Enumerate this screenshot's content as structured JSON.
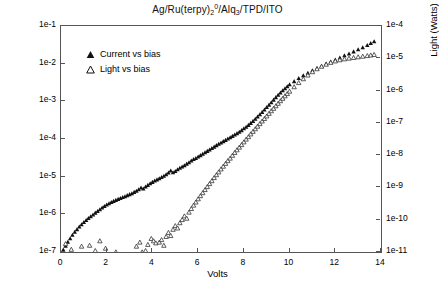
{
  "chart_data": {
    "type": "scatter",
    "title_parts": {
      "p1": "Ag/Ru(terpy)",
      "sub1": "2",
      "sup1": "0",
      "p2": "/Alq",
      "sub2": "3",
      "p3": "/TPD/ITO"
    },
    "xlabel": "Volts",
    "ylabel": "Current (Amps)",
    "ylabel_right": "Light (Watts)",
    "xlim": [
      0,
      14
    ],
    "xticks": [
      0,
      2,
      4,
      6,
      8,
      10,
      12,
      14
    ],
    "xticklabels": [
      "0",
      "2",
      "4",
      "6",
      "8",
      "10",
      "12",
      "14"
    ],
    "ylim_left": [
      1e-07,
      0.1
    ],
    "yticks_left": [
      1e-07,
      1e-06,
      1e-05,
      0.0001,
      0.001,
      0.01,
      0.1
    ],
    "yticklabels_left": [
      "1e-7",
      "1e-6",
      "1e-5",
      "1e-4",
      "1e-3",
      "1e-2",
      "1e-1"
    ],
    "ylim_right": [
      1e-11,
      0.0001
    ],
    "yticks_right": [
      1e-11,
      1e-10,
      1e-09,
      1e-08,
      1e-07,
      1e-06,
      1e-05,
      0.0001
    ],
    "yticklabels_right": [
      "1e-11",
      "1e-10",
      "1e-9",
      "1e-8",
      "1e-7",
      "1e-6",
      "1e-5",
      "1e-4"
    ],
    "yscale": "log",
    "grid": false,
    "legend_position": "upper left",
    "series": [
      {
        "name": "Current vs bias",
        "marker": "triangle-filled",
        "axis": "left",
        "color": "#111111",
        "points": [
          [
            0.1,
            1.15e-07
          ],
          [
            0.2,
            1.45e-07
          ],
          [
            0.3,
            1.85e-07
          ],
          [
            0.4,
            2.3e-07
          ],
          [
            0.5,
            2.85e-07
          ],
          [
            0.6,
            3.4e-07
          ],
          [
            0.7,
            4e-07
          ],
          [
            0.8,
            4.7e-07
          ],
          [
            0.9,
            5.4e-07
          ],
          [
            1.0,
            6.2e-07
          ],
          [
            1.1,
            7e-07
          ],
          [
            1.2,
            7.9e-07
          ],
          [
            1.3,
            8.8e-07
          ],
          [
            1.4,
            9.8e-07
          ],
          [
            1.5,
            1.1e-06
          ],
          [
            1.6,
            1.22e-06
          ],
          [
            1.7,
            1.35e-06
          ],
          [
            1.8,
            1.5e-06
          ],
          [
            1.9,
            1.65e-06
          ],
          [
            2.0,
            1.8e-06
          ],
          [
            2.1,
            1.95e-06
          ],
          [
            2.2,
            2.1e-06
          ],
          [
            2.3,
            2.25e-06
          ],
          [
            2.4,
            2.4e-06
          ],
          [
            2.5,
            2.55e-06
          ],
          [
            2.6,
            2.7e-06
          ],
          [
            2.7,
            2.85e-06
          ],
          [
            2.8,
            3e-06
          ],
          [
            2.9,
            3.2e-06
          ],
          [
            3.0,
            3.4e-06
          ],
          [
            3.1,
            3.6e-06
          ],
          [
            3.2,
            3.9e-06
          ],
          [
            3.3,
            4.2e-06
          ],
          [
            3.4,
            4.6e-06
          ],
          [
            3.5,
            5.1e-06
          ],
          [
            3.6,
            4.8e-06
          ],
          [
            3.7,
            5.4e-06
          ],
          [
            3.8,
            6e-06
          ],
          [
            3.9,
            6.6e-06
          ],
          [
            4.0,
            7.2e-06
          ],
          [
            4.1,
            7.8e-06
          ],
          [
            4.2,
            8.4e-06
          ],
          [
            4.3,
            9e-06
          ],
          [
            4.4,
            9.7e-06
          ],
          [
            4.5,
            1.05e-05
          ],
          [
            4.6,
            1.15e-05
          ],
          [
            4.7,
            1.28e-05
          ],
          [
            4.8,
            1.45e-05
          ],
          [
            4.9,
            1.3e-05
          ],
          [
            5.0,
            1.4e-05
          ],
          [
            5.1,
            1.55e-05
          ],
          [
            5.2,
            1.7e-05
          ],
          [
            5.3,
            1.85e-05
          ],
          [
            5.4,
            2e-05
          ],
          [
            5.5,
            2.2e-05
          ],
          [
            5.6,
            2.4e-05
          ],
          [
            5.7,
            2.65e-05
          ],
          [
            5.8,
            2.9e-05
          ],
          [
            5.9,
            3.1e-05
          ],
          [
            6.0,
            3.4e-05
          ],
          [
            6.1,
            3.7e-05
          ],
          [
            6.2,
            4e-05
          ],
          [
            6.3,
            4.4e-05
          ],
          [
            6.4,
            4.8e-05
          ],
          [
            6.5,
            5.2e-05
          ],
          [
            6.6,
            5.7e-05
          ],
          [
            6.7,
            6.2e-05
          ],
          [
            6.8,
            6.8e-05
          ],
          [
            6.9,
            7.4e-05
          ],
          [
            7.0,
            8e-05
          ],
          [
            7.1,
            8.7e-05
          ],
          [
            7.2,
            9.4e-05
          ],
          [
            7.3,
            0.000102
          ],
          [
            7.4,
            0.00011
          ],
          [
            7.5,
            0.00012
          ],
          [
            7.6,
            0.00013
          ],
          [
            7.7,
            0.000142
          ],
          [
            7.8,
            0.000155
          ],
          [
            7.9,
            0.00017
          ],
          [
            8.0,
            0.00019
          ],
          [
            8.1,
            0.00021
          ],
          [
            8.2,
            0.000235
          ],
          [
            8.3,
            0.000265
          ],
          [
            8.4,
            0.0003
          ],
          [
            8.5,
            0.00034
          ],
          [
            8.6,
            0.00039
          ],
          [
            8.7,
            0.00045
          ],
          [
            8.8,
            0.00052
          ],
          [
            8.9,
            0.0006
          ],
          [
            9.0,
            0.0007
          ],
          [
            9.1,
            0.00081
          ],
          [
            9.2,
            0.00094
          ],
          [
            9.3,
            0.0011
          ],
          [
            9.4,
            0.00128
          ],
          [
            9.5,
            0.00148
          ],
          [
            9.6,
            0.0017
          ],
          [
            9.7,
            0.00195
          ],
          [
            9.8,
            0.0022
          ],
          [
            9.9,
            0.0025
          ],
          [
            10.0,
            0.0028
          ],
          [
            10.2,
            0.0034
          ],
          [
            10.4,
            0.0041
          ],
          [
            10.6,
            0.0049
          ],
          [
            10.8,
            0.0057
          ],
          [
            11.0,
            0.0066
          ],
          [
            11.2,
            0.0076
          ],
          [
            11.4,
            0.0087
          ],
          [
            11.6,
            0.01
          ],
          [
            11.8,
            0.0113
          ],
          [
            12.0,
            0.0128
          ],
          [
            12.2,
            0.0145
          ],
          [
            12.4,
            0.0165
          ],
          [
            12.6,
            0.0185
          ],
          [
            12.8,
            0.021
          ],
          [
            13.0,
            0.024
          ],
          [
            13.2,
            0.027
          ],
          [
            13.4,
            0.031
          ],
          [
            13.55,
            0.035
          ],
          [
            13.7,
            0.039
          ]
        ]
      },
      {
        "name": "Light vs bias",
        "marker": "triangle-open",
        "axis": "right",
        "color": "#333333",
        "points": [
          [
            0.2,
            1.8e-11
          ],
          [
            0.45,
            1.2e-11
          ],
          [
            0.9,
            1.5e-11
          ],
          [
            1.25,
            1.6e-11
          ],
          [
            1.5,
            1.1e-11
          ],
          [
            1.7,
            2.2e-11
          ],
          [
            1.95,
            1.3e-11
          ],
          [
            2.4,
            1e-11
          ],
          [
            3.3,
            1.5e-11
          ],
          [
            3.45,
            2e-11
          ],
          [
            3.55,
            1e-11
          ],
          [
            3.7,
            1.1e-11
          ],
          [
            3.8,
            1.7e-11
          ],
          [
            3.95,
            2.6e-11
          ],
          [
            4.05,
            2.2e-11
          ],
          [
            4.15,
            1.9e-11
          ],
          [
            4.3,
            2e-11
          ],
          [
            4.4,
            2.4e-11
          ],
          [
            4.5,
            1.6e-11
          ],
          [
            4.6,
            3e-11
          ],
          [
            4.7,
            4e-11
          ],
          [
            4.8,
            3.2e-11
          ],
          [
            4.9,
            5e-11
          ],
          [
            5.0,
            6.5e-11
          ],
          [
            5.1,
            5.5e-11
          ],
          [
            5.2,
            8e-11
          ],
          [
            5.3,
            1e-10
          ],
          [
            5.4,
            1.3e-10
          ],
          [
            5.5,
            1.1e-10
          ],
          [
            5.6,
            1.7e-10
          ],
          [
            5.7,
            2.2e-10
          ],
          [
            5.8,
            2.8e-10
          ],
          [
            5.9,
            3.5e-10
          ],
          [
            6.0,
            4.4e-10
          ],
          [
            6.1,
            5.5e-10
          ],
          [
            6.2,
            6.8e-10
          ],
          [
            6.3,
            8.5e-10
          ],
          [
            6.4,
            1.05e-09
          ],
          [
            6.5,
            1.3e-09
          ],
          [
            6.6,
            1.6e-09
          ],
          [
            6.7,
            2e-09
          ],
          [
            6.8,
            2.45e-09
          ],
          [
            6.9,
            3e-09
          ],
          [
            7.0,
            3.7e-09
          ],
          [
            7.1,
            4.5e-09
          ],
          [
            7.2,
            5.5e-09
          ],
          [
            7.3,
            6.7e-09
          ],
          [
            7.4,
            8e-09
          ],
          [
            7.5,
            9.8e-09
          ],
          [
            7.6,
            1.2e-08
          ],
          [
            7.7,
            1.45e-08
          ],
          [
            7.8,
            1.75e-08
          ],
          [
            7.9,
            2.1e-08
          ],
          [
            8.0,
            2.55e-08
          ],
          [
            8.1,
            3.1e-08
          ],
          [
            8.2,
            3.7e-08
          ],
          [
            8.3,
            4.5e-08
          ],
          [
            8.4,
            5.4e-08
          ],
          [
            8.5,
            6.5e-08
          ],
          [
            8.6,
            7.8e-08
          ],
          [
            8.7,
            9.4e-08
          ],
          [
            8.8,
            1.13e-07
          ],
          [
            8.9,
            1.35e-07
          ],
          [
            9.0,
            1.62e-07
          ],
          [
            9.1,
            1.95e-07
          ],
          [
            9.2,
            2.35e-07
          ],
          [
            9.3,
            2.8e-07
          ],
          [
            9.4,
            3.35e-07
          ],
          [
            9.5,
            4e-07
          ],
          [
            9.6,
            4.8e-07
          ],
          [
            9.7,
            5.7e-07
          ],
          [
            9.8,
            6.8e-07
          ],
          [
            9.9,
            8e-07
          ],
          [
            10.0,
            9.5e-07
          ],
          [
            10.2,
            1.3e-06
          ],
          [
            10.4,
            1.75e-06
          ],
          [
            10.6,
            2.3e-06
          ],
          [
            10.8,
            3e-06
          ],
          [
            11.0,
            3.8e-06
          ],
          [
            11.2,
            4.7e-06
          ],
          [
            11.4,
            5.6e-06
          ],
          [
            11.6,
            6.5e-06
          ],
          [
            11.8,
            7.4e-06
          ],
          [
            12.0,
            8.2e-06
          ],
          [
            12.2,
            8.9e-06
          ],
          [
            12.4,
            9.5e-06
          ],
          [
            12.6,
            1e-05
          ],
          [
            12.8,
            1.05e-05
          ],
          [
            13.0,
            1.1e-05
          ],
          [
            13.2,
            1.15e-05
          ],
          [
            13.4,
            1.2e-05
          ],
          [
            13.55,
            1.25e-05
          ],
          [
            13.7,
            1.3e-05
          ]
        ]
      }
    ]
  },
  "legend": {
    "items": [
      {
        "label": "Current vs bias",
        "marker": "triangle-filled"
      },
      {
        "label": "Light vs bias",
        "marker": "triangle-open"
      }
    ]
  }
}
